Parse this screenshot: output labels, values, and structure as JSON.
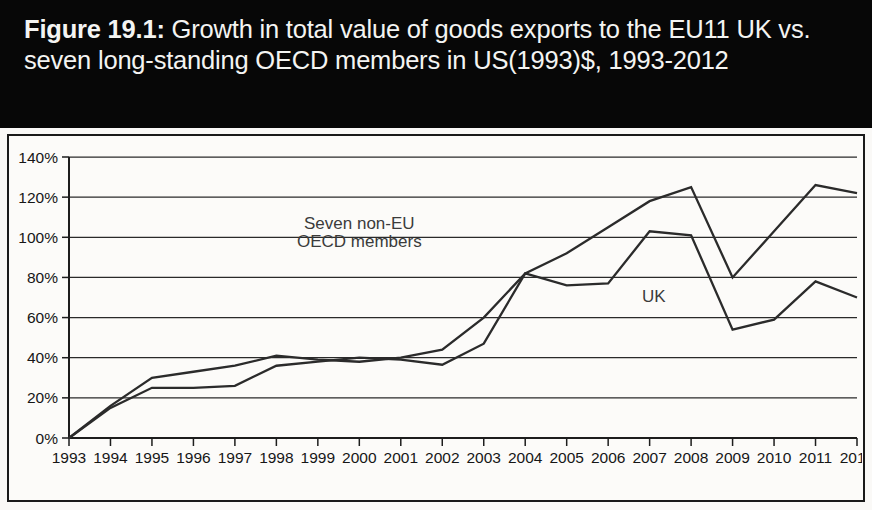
{
  "figure": {
    "label": "Figure 19.1:",
    "title_rest": " Growth in total value of goods exports to the EU11 UK vs. seven long-standing OECD members in US(1993)$, 1993-2012",
    "banner_color": "#070707",
    "banner_text_color": "#f4f4f2"
  },
  "chart_data": {
    "type": "line",
    "title": "Figure 19.1: Growth in total value of goods exports to the EU11 UK vs. seven long-standing OECD members in US(1993)$, 1993-2012",
    "xlabel": "",
    "ylabel": "",
    "categories": [
      "1993",
      "1994",
      "1995",
      "1996",
      "1997",
      "1998",
      "1999",
      "2000",
      "2001",
      "2002",
      "2003",
      "2004",
      "2005",
      "2006",
      "2007",
      "2008",
      "2009",
      "2010",
      "2011",
      "2012"
    ],
    "x": [
      1993,
      1994,
      1995,
      1996,
      1997,
      1998,
      1999,
      2000,
      2001,
      2002,
      2003,
      2004,
      2005,
      2006,
      2007,
      2008,
      2009,
      2010,
      2011,
      2012
    ],
    "ylim": [
      0,
      140
    ],
    "xlim": [
      1993,
      2012
    ],
    "ytick_labels": [
      "0%",
      "20%",
      "40%",
      "60%",
      "80%",
      "100%",
      "120%",
      "140%"
    ],
    "ytick_values": [
      0,
      20,
      40,
      60,
      80,
      100,
      120,
      140
    ],
    "grid": true,
    "grid_axis": "y",
    "legend_position": "inline-annotations",
    "line_color": "#2b2b2b",
    "series": [
      {
        "name": "Seven non-EU OECD members",
        "label_text_line1": "Seven non-EU",
        "label_text_line2": "OECD members",
        "values": [
          0,
          16,
          30,
          33,
          36,
          41,
          39,
          38,
          40,
          44,
          60,
          82,
          92,
          105,
          118,
          125,
          80,
          103,
          126,
          122
        ]
      },
      {
        "name": "UK",
        "label_text_line1": "UK",
        "label_text_line2": "",
        "values": [
          0,
          15,
          25,
          25,
          26,
          36,
          38,
          40,
          39,
          36.5,
          47,
          82,
          76,
          77,
          103,
          101,
          54,
          59,
          78,
          70
        ]
      }
    ],
    "annotations": [
      {
        "text": "Seven non-EU",
        "x": 2000.0,
        "y": 104
      },
      {
        "text": "OECD members",
        "x": 2000.0,
        "y": 95
      },
      {
        "text": "UK",
        "x": 2007.1,
        "y": 68
      }
    ]
  }
}
